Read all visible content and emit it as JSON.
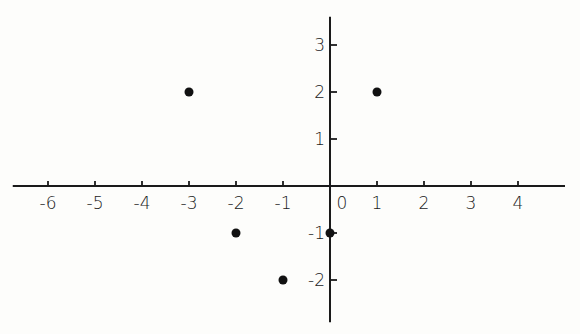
{
  "chart_data": {
    "type": "scatter",
    "title": "",
    "xlabel": "",
    "ylabel": "",
    "xlim": [
      -6.75,
      5.0
    ],
    "ylim": [
      -2.9,
      3.6
    ],
    "grid": false,
    "x_ticks": [
      -6,
      -5,
      -4,
      -3,
      -2,
      -1,
      1,
      2,
      3,
      4
    ],
    "x_tick_labels": [
      "-6",
      "-5",
      "-4",
      "-3",
      "-2",
      "-1",
      "1",
      "2",
      "3",
      "4"
    ],
    "origin_label": "0",
    "y_ticks": [
      3,
      2,
      1,
      -1,
      -2
    ],
    "y_tick_labels": [
      "3",
      "2",
      "1",
      "-1",
      "-2"
    ],
    "points": [
      {
        "x": -3,
        "y": 2
      },
      {
        "x": 1,
        "y": 2
      },
      {
        "x": -2,
        "y": -1
      },
      {
        "x": 0,
        "y": -1
      },
      {
        "x": -1,
        "y": -2
      }
    ]
  }
}
